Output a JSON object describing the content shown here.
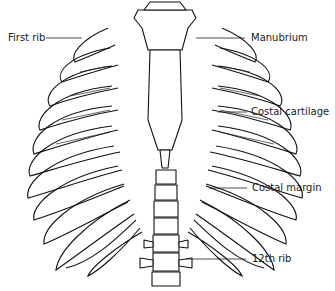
{
  "diagram": {
    "labels": [
      {
        "id": "first-rib",
        "text": "First rib",
        "side": "left"
      },
      {
        "id": "manubrium",
        "text": "Manubrium",
        "side": "right"
      },
      {
        "id": "costal-cartilage",
        "text": "Costal cartilage",
        "side": "right"
      },
      {
        "id": "costal-margin",
        "text": "Costal margin",
        "side": "right"
      },
      {
        "id": "12th-rib",
        "text": "12th rib",
        "side": "right"
      }
    ],
    "colors": {
      "line": "#111111",
      "background": "#ffffff",
      "text": "#1a1a1a"
    }
  }
}
